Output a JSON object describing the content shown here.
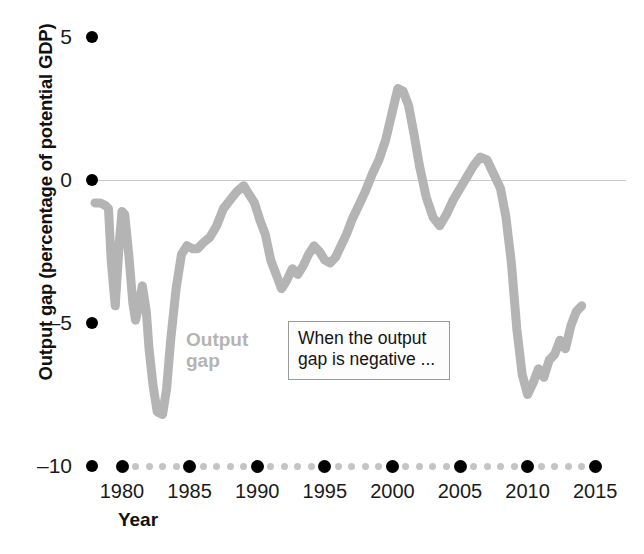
{
  "chart_data": {
    "type": "line",
    "title": "",
    "subtitle": "",
    "xlabel": "Year",
    "ylabel": "Output gap (percentage of potential GDP)",
    "xlim": [
      1978,
      2015.5
    ],
    "ylim": [
      -10,
      5
    ],
    "grid": false,
    "zero_line": true,
    "legend_position": "inline-label",
    "series": [
      {
        "name": "Output gap",
        "color": "#b4b4b4",
        "x": [
          1978.0,
          1978.4,
          1978.8,
          1979.0,
          1979.2,
          1979.5,
          1979.8,
          1980.0,
          1980.2,
          1980.5,
          1980.8,
          1981.0,
          1981.2,
          1981.5,
          1981.8,
          1982.0,
          1982.3,
          1982.6,
          1983.0,
          1983.3,
          1983.6,
          1984.0,
          1984.4,
          1984.8,
          1985.2,
          1985.6,
          1986.0,
          1986.5,
          1987.0,
          1987.5,
          1988.0,
          1988.5,
          1989.0,
          1989.4,
          1989.8,
          1990.2,
          1990.6,
          1991.0,
          1991.4,
          1991.8,
          1992.2,
          1992.6,
          1993.0,
          1993.4,
          1993.8,
          1994.2,
          1994.6,
          1995.0,
          1995.4,
          1995.8,
          1996.2,
          1996.6,
          1997.0,
          1997.5,
          1998.0,
          1998.5,
          1999.0,
          1999.5,
          2000.0,
          2000.4,
          2000.8,
          2001.2,
          2001.6,
          2002.0,
          2002.5,
          2003.0,
          2003.5,
          2004.0,
          2004.5,
          2005.0,
          2005.5,
          2006.0,
          2006.5,
          2007.0,
          2007.5,
          2008.0,
          2008.4,
          2008.8,
          2009.2,
          2009.6,
          2010.0,
          2010.4,
          2010.8,
          2011.2,
          2011.6,
          2012.0,
          2012.4,
          2012.8,
          2013.2,
          2013.6,
          2014.0
        ],
        "y": [
          -0.8,
          -0.8,
          -0.9,
          -1.0,
          -2.8,
          -4.4,
          -2.2,
          -1.1,
          -1.2,
          -2.6,
          -4.3,
          -4.9,
          -4.5,
          -3.7,
          -4.6,
          -5.9,
          -7.2,
          -8.1,
          -8.2,
          -7.3,
          -5.6,
          -3.8,
          -2.6,
          -2.3,
          -2.4,
          -2.4,
          -2.2,
          -2.0,
          -1.6,
          -1.0,
          -0.7,
          -0.4,
          -0.2,
          -0.5,
          -0.8,
          -1.4,
          -1.9,
          -2.8,
          -3.3,
          -3.8,
          -3.5,
          -3.1,
          -3.3,
          -3.0,
          -2.6,
          -2.3,
          -2.5,
          -2.8,
          -2.9,
          -2.7,
          -2.3,
          -1.9,
          -1.4,
          -0.9,
          -0.4,
          0.2,
          0.7,
          1.4,
          2.4,
          3.2,
          3.1,
          2.6,
          1.6,
          0.5,
          -0.6,
          -1.3,
          -1.6,
          -1.2,
          -0.7,
          -0.3,
          0.1,
          0.5,
          0.8,
          0.7,
          0.2,
          -0.3,
          -1.3,
          -2.9,
          -5.2,
          -6.8,
          -7.5,
          -7.1,
          -6.6,
          -6.9,
          -6.3,
          -6.1,
          -5.6,
          -5.9,
          -5.1,
          -4.6,
          -4.4
        ]
      }
    ],
    "annotations": [
      {
        "name": "negative-gap-callout",
        "text": "When the output\ngap is negative ..."
      }
    ]
  },
  "yaxis": {
    "title": "Output gap (percentage of potential GDP)",
    "ticks": [
      {
        "label": "5",
        "value": 5
      },
      {
        "label": "0",
        "value": 0
      },
      {
        "label": "–5",
        "value": -5
      },
      {
        "label": "–10",
        "value": -10
      }
    ]
  },
  "xaxis": {
    "title": "Year",
    "ticks": [
      {
        "label": "1980",
        "value": 1980
      },
      {
        "label": "1985",
        "value": 1985
      },
      {
        "label": "1990",
        "value": 1990
      },
      {
        "label": "1995",
        "value": 1995
      },
      {
        "label": "2000",
        "value": 2000
      },
      {
        "label": "2005",
        "value": 2005
      },
      {
        "label": "2010",
        "value": 2010
      },
      {
        "label": "2015",
        "value": 2015
      }
    ]
  },
  "series_label": {
    "text": "Output\ngap",
    "color": "#b4b4b4"
  },
  "annotation": {
    "text": "When the output\ngap is negative ..."
  },
  "colors": {
    "series": "#b4b4b4",
    "axis_text": "#1a1a1a",
    "axis_marker": "#000000",
    "minor_dot": "#c4c4c4",
    "zero_line": "#c9c9c9",
    "background": "#ffffff"
  }
}
